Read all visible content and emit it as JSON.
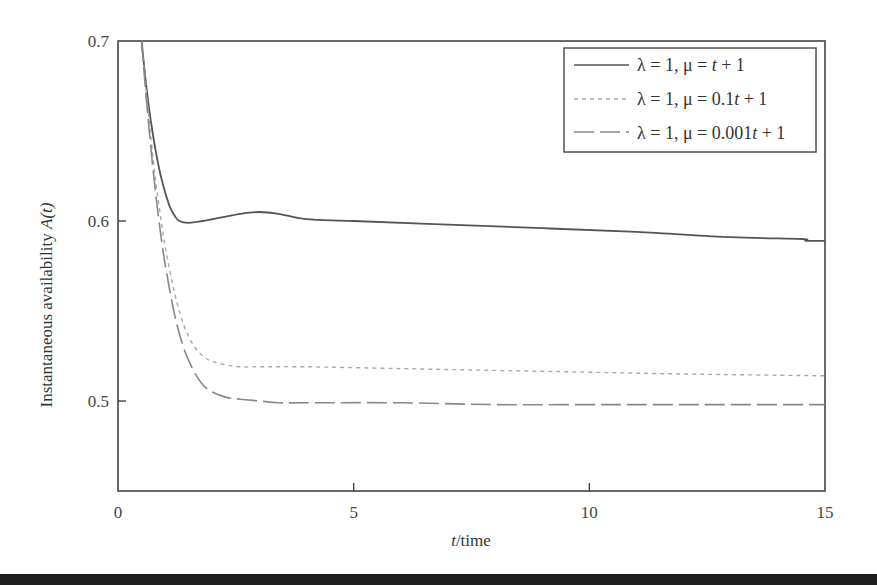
{
  "chart_data": {
    "type": "line",
    "title": "",
    "xlabel_italic": "t",
    "xlabel_rest": "/time",
    "ylabel_main": "Instantaneous availability ",
    "ylabel_italic": "A(t)",
    "xlim": [
      0,
      15
    ],
    "ylim": [
      0.45,
      0.7
    ],
    "xticks": [
      0,
      5,
      10,
      15
    ],
    "xtick_labels": [
      "0",
      "5",
      "10",
      "15"
    ],
    "yticks": [
      0.5,
      0.6,
      0.7
    ],
    "ytick_labels": [
      "0.5",
      "0.6",
      "0.7"
    ],
    "grid": false,
    "legend_position": "upper right",
    "series": [
      {
        "name": "λ = 1, μ = t + 1",
        "style": "solid",
        "color": "#555555",
        "x": [
          0.5,
          0.6,
          0.7,
          0.8,
          0.9,
          1.0,
          1.1,
          1.2,
          1.3,
          1.5,
          1.8,
          2.2,
          2.6,
          3.0,
          3.4,
          4.0,
          5.0,
          7.0,
          9.0,
          11.0,
          13.0,
          14.5,
          14.6,
          15.0
        ],
        "values": [
          0.7,
          0.675,
          0.655,
          0.639,
          0.626,
          0.616,
          0.608,
          0.603,
          0.6,
          0.599,
          0.6,
          0.602,
          0.604,
          0.605,
          0.604,
          0.601,
          0.6,
          0.598,
          0.596,
          0.594,
          0.591,
          0.59,
          0.589,
          0.589
        ]
      },
      {
        "name": "λ = 1, μ = 0.1t + 1",
        "style": "dotted",
        "color": "#aaaaaa",
        "x": [
          0.5,
          0.6,
          0.7,
          0.8,
          0.9,
          1.0,
          1.2,
          1.4,
          1.6,
          1.8,
          2.0,
          2.3,
          2.6,
          3.0,
          4.0,
          6.0,
          8.0,
          10.0,
          12.0,
          15.0
        ],
        "values": [
          0.7,
          0.672,
          0.646,
          0.622,
          0.603,
          0.586,
          0.56,
          0.542,
          0.531,
          0.525,
          0.522,
          0.52,
          0.519,
          0.519,
          0.519,
          0.518,
          0.517,
          0.516,
          0.515,
          0.514
        ]
      },
      {
        "name": "λ = 1, μ = 0.001t + 1",
        "style": "dashed",
        "color": "#888888",
        "x": [
          0.5,
          0.6,
          0.7,
          0.8,
          0.9,
          1.0,
          1.2,
          1.4,
          1.6,
          1.8,
          2.0,
          2.3,
          2.6,
          3.0,
          3.4,
          4.0,
          6.0,
          8.0,
          10.0,
          12.0,
          15.0
        ],
        "values": [
          0.7,
          0.668,
          0.64,
          0.615,
          0.594,
          0.576,
          0.548,
          0.529,
          0.517,
          0.509,
          0.505,
          0.502,
          0.501,
          0.5,
          0.499,
          0.499,
          0.499,
          0.498,
          0.498,
          0.498,
          0.498
        ]
      }
    ],
    "legend": [
      {
        "prefix": "λ = 1, μ = ",
        "expr_italic": "t",
        "suffix": " + 1",
        "coef": ""
      },
      {
        "prefix": "λ = 1, μ = 0.1",
        "expr_italic": "t",
        "suffix": " + 1",
        "coef": "0.1"
      },
      {
        "prefix": "λ = 1, μ = 0.001",
        "expr_italic": "t",
        "suffix": " + 1",
        "coef": "0.001"
      }
    ]
  }
}
